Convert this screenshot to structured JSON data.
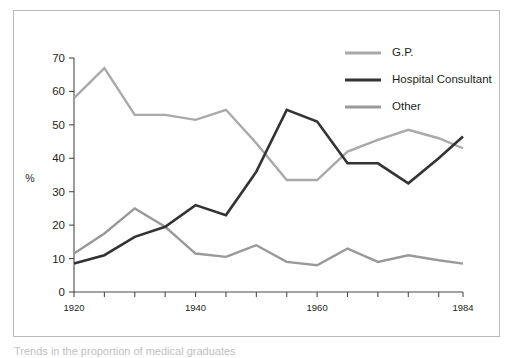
{
  "figure": {
    "border_color": "#b9b9b9",
    "background": "#ffffff",
    "caption": "Trends in the proportion of medical graduates"
  },
  "axes": {
    "y_title": "%",
    "y_ticks": [
      "0",
      "10",
      "20",
      "30",
      "40",
      "50",
      "60",
      "70"
    ],
    "x_ticks_labeled": [
      "1920",
      "1940",
      "1960",
      "1984"
    ],
    "x_tick_years": [
      1920,
      1925,
      1930,
      1935,
      1940,
      1945,
      1950,
      1955,
      1960,
      1965,
      1970,
      1975,
      1980,
      1984
    ]
  },
  "legend": {
    "position": "top-right",
    "items": [
      {
        "label": "G.P.",
        "color": "#a9a9a9"
      },
      {
        "label": "Hospital Consultant",
        "color": "#333333"
      },
      {
        "label": "Other",
        "color": "#999999"
      }
    ]
  },
  "chart_data": {
    "type": "line",
    "title": "",
    "subtitle": "",
    "xlabel": "",
    "ylabel": "%",
    "xlim": [
      1920,
      1984
    ],
    "ylim": [
      0,
      70
    ],
    "grid": false,
    "legend_position": "top-right",
    "x": [
      1920,
      1925,
      1930,
      1935,
      1940,
      1945,
      1950,
      1955,
      1960,
      1965,
      1970,
      1975,
      1980,
      1984
    ],
    "series": [
      {
        "name": "G.P.",
        "color": "#a9a9a9",
        "values": [
          58.0,
          67.0,
          53.0,
          53.0,
          51.5,
          54.5,
          44.5,
          33.5,
          33.5,
          42.0,
          45.5,
          48.5,
          46.0,
          43.0
        ]
      },
      {
        "name": "Hospital Consultant",
        "color": "#333333",
        "values": [
          8.5,
          11.0,
          16.5,
          19.5,
          26.0,
          23.0,
          36.0,
          54.5,
          51.0,
          38.5,
          38.5,
          32.5,
          40.0,
          46.5
        ]
      },
      {
        "name": "Other",
        "color": "#999999",
        "values": [
          11.5,
          17.5,
          25.0,
          19.5,
          11.5,
          10.5,
          14.0,
          9.0,
          8.0,
          13.0,
          9.0,
          11.0,
          9.5,
          8.5
        ]
      }
    ]
  }
}
